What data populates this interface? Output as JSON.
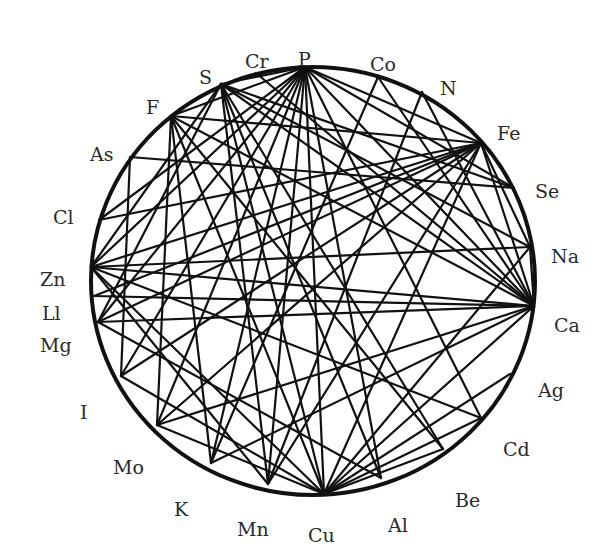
{
  "diagram": {
    "type": "chord-network",
    "circle": {
      "cx": 313,
      "cy": 281,
      "rx": 222,
      "ry": 214
    },
    "colors": {
      "line": "#111111",
      "label": "#2a2a2a",
      "background": "#ffffff"
    },
    "nodes": [
      {
        "id": "P",
        "label": "P",
        "x": 305,
        "y": 67,
        "lx": 298,
        "ly": 52
      },
      {
        "id": "Cr",
        "label": "Cr",
        "x": 256,
        "y": 73,
        "lx": 245,
        "ly": 54
      },
      {
        "id": "S",
        "label": "S",
        "x": 221,
        "y": 84,
        "lx": 199,
        "ly": 70
      },
      {
        "id": "F",
        "label": "F",
        "x": 171,
        "y": 116,
        "lx": 146,
        "ly": 100
      },
      {
        "id": "As",
        "label": "As",
        "x": 130,
        "y": 157,
        "lx": 90,
        "ly": 147
      },
      {
        "id": "Cl",
        "label": "Cl",
        "x": 99,
        "y": 220,
        "lx": 53,
        "ly": 210
      },
      {
        "id": "Zn",
        "label": "Zn",
        "x": 91,
        "y": 267,
        "lx": 40,
        "ly": 272
      },
      {
        "id": "Ll",
        "label": "Ll",
        "x": 94,
        "y": 296,
        "lx": 42,
        "ly": 306
      },
      {
        "id": "Mg",
        "label": "Mg",
        "x": 98,
        "y": 322,
        "lx": 40,
        "ly": 338
      },
      {
        "id": "I",
        "label": "I",
        "x": 121,
        "y": 376,
        "lx": 80,
        "ly": 405
      },
      {
        "id": "Mo",
        "label": "Mo",
        "x": 157,
        "y": 425,
        "lx": 113,
        "ly": 460
      },
      {
        "id": "K",
        "label": "K",
        "x": 211,
        "y": 463,
        "lx": 174,
        "ly": 502
      },
      {
        "id": "Mn",
        "label": "Mn",
        "x": 268,
        "y": 484,
        "lx": 237,
        "ly": 522
      },
      {
        "id": "Cu",
        "label": "Cu",
        "x": 324,
        "y": 494,
        "lx": 308,
        "ly": 528
      },
      {
        "id": "Al",
        "label": "Al",
        "x": 381,
        "y": 478,
        "lx": 388,
        "ly": 518
      },
      {
        "id": "Be",
        "label": "Be",
        "x": 443,
        "y": 449,
        "lx": 455,
        "ly": 493
      },
      {
        "id": "Cd",
        "label": "Cd",
        "x": 481,
        "y": 418,
        "lx": 503,
        "ly": 442
      },
      {
        "id": "Ag",
        "label": "Ag",
        "x": 510,
        "y": 374,
        "lx": 538,
        "ly": 383
      },
      {
        "id": "Ca",
        "label": "Ca",
        "x": 534,
        "y": 306,
        "lx": 554,
        "ly": 318
      },
      {
        "id": "Na",
        "label": "Na",
        "x": 530,
        "y": 247,
        "lx": 551,
        "ly": 249
      },
      {
        "id": "Se",
        "label": "Se",
        "x": 514,
        "y": 188,
        "lx": 535,
        "ly": 184
      },
      {
        "id": "Fe",
        "label": "Fe",
        "x": 481,
        "y": 143,
        "lx": 497,
        "ly": 126
      },
      {
        "id": "N",
        "label": "N",
        "x": 422,
        "y": 92,
        "lx": 440,
        "ly": 81
      },
      {
        "id": "Co",
        "label": "Co",
        "x": 378,
        "y": 77,
        "lx": 370,
        "ly": 57
      }
    ],
    "edges": [
      [
        "P",
        "S"
      ],
      [
        "P",
        "F"
      ],
      [
        "P",
        "Zn"
      ],
      [
        "P",
        "Mg"
      ],
      [
        "P",
        "Mo"
      ],
      [
        "P",
        "K"
      ],
      [
        "P",
        "Mn"
      ],
      [
        "P",
        "Cu"
      ],
      [
        "P",
        "Al"
      ],
      [
        "P",
        "Cd"
      ],
      [
        "P",
        "Ca"
      ],
      [
        "P",
        "Se"
      ],
      [
        "P",
        "Fe"
      ],
      [
        "P",
        "I"
      ],
      [
        "Cr",
        "Ca"
      ],
      [
        "S",
        "Zn"
      ],
      [
        "S",
        "Mg"
      ],
      [
        "S",
        "Mn"
      ],
      [
        "S",
        "Cu"
      ],
      [
        "S",
        "Ca"
      ],
      [
        "S",
        "Se"
      ],
      [
        "S",
        "Na"
      ],
      [
        "S",
        "Be"
      ],
      [
        "F",
        "Mo"
      ],
      [
        "F",
        "K"
      ],
      [
        "F",
        "Cu"
      ],
      [
        "F",
        "Ca"
      ],
      [
        "F",
        "Be"
      ],
      [
        "F",
        "Fe"
      ],
      [
        "As",
        "I"
      ],
      [
        "As",
        "Se"
      ],
      [
        "Cl",
        "P"
      ],
      [
        "Cl",
        "Fe"
      ],
      [
        "Zn",
        "Fe"
      ],
      [
        "Zn",
        "Ca"
      ],
      [
        "Zn",
        "Cd"
      ],
      [
        "Zn",
        "Na"
      ],
      [
        "Zn",
        "Cu"
      ],
      [
        "Zn",
        "Mn"
      ],
      [
        "Ll",
        "Fe"
      ],
      [
        "Ll",
        "Ca"
      ],
      [
        "Mg",
        "Ca"
      ],
      [
        "Mg",
        "Fe"
      ],
      [
        "Mg",
        "Al"
      ],
      [
        "I",
        "Fe"
      ],
      [
        "I",
        "Cu"
      ],
      [
        "Mo",
        "Fe"
      ],
      [
        "Mo",
        "Cu"
      ],
      [
        "Mo",
        "Ca"
      ],
      [
        "K",
        "Ca"
      ],
      [
        "K",
        "Co"
      ],
      [
        "Mn",
        "Fe"
      ],
      [
        "Mn",
        "N"
      ],
      [
        "Cu",
        "Fe"
      ],
      [
        "Cu",
        "Ca"
      ],
      [
        "Cu",
        "Ag"
      ],
      [
        "Cu",
        "Cd"
      ],
      [
        "Cu",
        "Be"
      ],
      [
        "Cu",
        "Na"
      ],
      [
        "Al",
        "S"
      ],
      [
        "Ca",
        "N"
      ],
      [
        "Ca",
        "Fe"
      ],
      [
        "Ca",
        "Co"
      ],
      [
        "Na",
        "Fe"
      ],
      [
        "Ca",
        "Na"
      ]
    ]
  }
}
